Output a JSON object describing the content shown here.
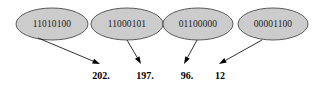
{
  "diagram": {
    "background_color": "#ffffff",
    "ellipse_fill": "#cccccc",
    "ellipse_stroke": "#5a5a5a",
    "arrow_color": "#000000",
    "nodes": [
      {
        "binary": "11010100",
        "decimal": "202.",
        "ellipse": {
          "cx": 52,
          "cy": 24,
          "rx": 36,
          "ry": 16
        },
        "arrow": {
          "x1": 38,
          "y1": 38,
          "x2": 100,
          "y2": 64
        },
        "label": {
          "x": 101,
          "y": 79
        }
      },
      {
        "binary": "11000101",
        "decimal": "197.",
        "ellipse": {
          "cx": 127,
          "cy": 24,
          "rx": 36,
          "ry": 16
        },
        "arrow": {
          "x1": 127,
          "y1": 40,
          "x2": 141,
          "y2": 64
        },
        "label": {
          "x": 145,
          "y": 79
        }
      },
      {
        "binary": "01100000",
        "decimal": "96.",
        "ellipse": {
          "cx": 198,
          "cy": 24,
          "rx": 35,
          "ry": 16
        },
        "arrow": {
          "x1": 197,
          "y1": 40,
          "x2": 184,
          "y2": 64
        },
        "label": {
          "x": 187,
          "y": 79
        }
      },
      {
        "binary": "00001100",
        "decimal": "12",
        "ellipse": {
          "cx": 273,
          "cy": 24,
          "rx": 35,
          "ry": 16
        },
        "arrow": {
          "x1": 262,
          "y1": 40,
          "x2": 219,
          "y2": 64
        },
        "label": {
          "x": 220,
          "y": 79
        }
      }
    ]
  }
}
